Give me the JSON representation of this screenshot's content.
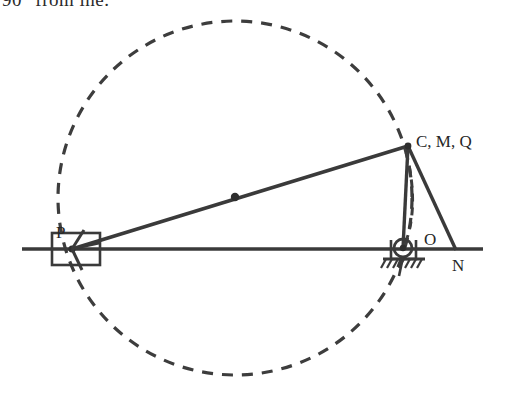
{
  "caption": {
    "clipped_text": "90° from lhe."
  },
  "figure": {
    "colors": {
      "stroke": "#3a3a3a",
      "dashed": "#3d3d3d",
      "background": "#ffffff",
      "label": "#262626"
    },
    "labels": [
      {
        "id": "P",
        "text": "P",
        "x": 56,
        "y": 238
      },
      {
        "id": "CMQ",
        "text": "C, M, Q",
        "x": 416,
        "y": 147
      },
      {
        "id": "O",
        "text": "O",
        "x": 424,
        "y": 245
      },
      {
        "id": "N",
        "text": "N",
        "x": 452,
        "y": 271
      }
    ],
    "geometry": {
      "ground_line": {
        "x1": 22,
        "y1": 249,
        "x2": 483,
        "y2": 249
      },
      "circle": {
        "cx": 235,
        "cy": 198,
        "r": 177,
        "dash": "11 9"
      },
      "link_PC": {
        "x1": 72,
        "y1": 249,
        "x2": 408,
        "y2": 146
      },
      "link_CO": {
        "x1": 408,
        "y1": 146,
        "x2": 403,
        "y2": 248
      },
      "link_CN": {
        "x1": 408,
        "y1": 146,
        "x2": 456,
        "y2": 250
      },
      "arc_CO_dashed": "M 406 152 C 416 190 414 224 404 246",
      "midpoint_dot": {
        "cx": 235,
        "cy": 197,
        "r": 4.2
      },
      "slider_block": {
        "x": 52,
        "y": 233,
        "w": 48,
        "h": 32
      },
      "pivot": {
        "cx": 403,
        "cy": 248,
        "r": 9
      },
      "ground_hatch": {
        "x": 384,
        "y": 258,
        "w": 40,
        "count": 7
      }
    }
  }
}
